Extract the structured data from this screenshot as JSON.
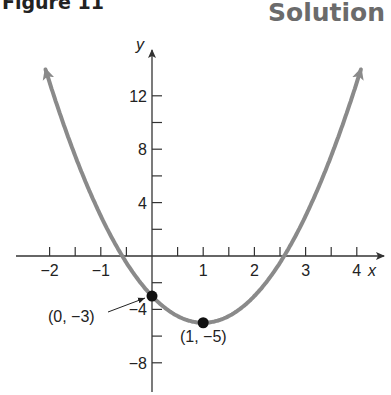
{
  "header": {
    "figure_label": "Figure 11",
    "section_label": "Solution"
  },
  "colors": {
    "curve": "#8a8a8a",
    "axis": "#333333",
    "point": "#111111"
  },
  "chart_data": {
    "type": "line",
    "title": "Figure 11",
    "function": "y = 2x^2 - 4x - 3",
    "xlabel": "x",
    "ylabel": "y",
    "xlim": [
      -2.3,
      4.3
    ],
    "ylim": [
      -10,
      16
    ],
    "x_ticks": [
      -2,
      -1.5,
      -1,
      -0.5,
      0.5,
      1,
      1.5,
      2,
      2.5,
      3,
      3.5,
      4
    ],
    "x_tick_labels": [
      "-2",
      "-1",
      "1",
      "2",
      "3",
      "4"
    ],
    "y_ticks": [
      -8,
      -6,
      -4,
      -2,
      2,
      4,
      6,
      8,
      10,
      12
    ],
    "y_tick_labels": [
      "-8",
      "-4",
      "4",
      "8",
      "12"
    ],
    "grid": false,
    "series": [
      {
        "name": "parabola",
        "x": [
          -2.08,
          -1.5,
          -1,
          -0.5,
          0,
          0.5,
          1,
          1.5,
          2,
          2.5,
          3,
          3.5,
          4,
          4.08
        ],
        "values": [
          13.97,
          7.5,
          3,
          -0.5,
          -3,
          -4.5,
          -5,
          -4.5,
          -3,
          -0.5,
          3,
          7.5,
          13,
          13.97
        ]
      }
    ],
    "annotations": [
      {
        "label": "(0, −3)",
        "x": 0,
        "y": -3
      },
      {
        "label": "(1, −5)",
        "x": 1,
        "y": -5
      }
    ]
  }
}
